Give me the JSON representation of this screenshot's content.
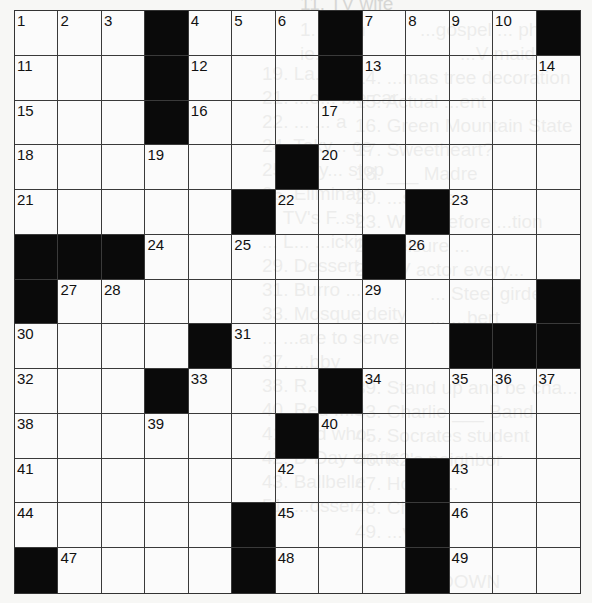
{
  "puzzle": {
    "rows": 13,
    "cols": 13,
    "colors": {
      "block": "#0a0a0a",
      "line": "#3a3a3a",
      "paper": "#f7f7f5",
      "ghost": "#d6d6d4"
    },
    "layout": [
      [
        "1",
        "2",
        "3",
        "#",
        "4",
        "5",
        "6",
        "#",
        "7",
        "8",
        "9",
        "10",
        "#"
      ],
      [
        "11",
        "",
        "",
        "#",
        "12",
        "",
        "",
        "#",
        "13",
        "",
        "",
        "",
        "14"
      ],
      [
        "15",
        "",
        "",
        "#",
        "16",
        "",
        "",
        "17",
        "",
        "",
        "",
        "",
        ""
      ],
      [
        "18",
        "",
        "",
        "19",
        "",
        "",
        "#",
        "20",
        "",
        "",
        "",
        "",
        ""
      ],
      [
        "21",
        "",
        "",
        "",
        "",
        "#",
        "22",
        "",
        "",
        "#",
        "23",
        "",
        ""
      ],
      [
        "#",
        "#",
        "#",
        "24",
        "",
        "25",
        "",
        "",
        "#",
        "26",
        "",
        "",
        ""
      ],
      [
        "#",
        "27",
        "28",
        "",
        "",
        "",
        "",
        "",
        "29",
        "",
        "",
        "",
        "#"
      ],
      [
        "30",
        "",
        "",
        "",
        "#",
        "31",
        "",
        "",
        "",
        "",
        "#",
        "#",
        "#"
      ],
      [
        "32",
        "",
        "",
        "#",
        "33",
        "",
        "",
        "#",
        "34",
        "",
        "35",
        "36",
        "37"
      ],
      [
        "38",
        "",
        "",
        "39",
        "",
        "",
        "#",
        "40",
        "",
        "",
        "",
        "",
        ""
      ],
      [
        "41",
        "",
        "",
        "",
        "",
        "",
        "42",
        "",
        "",
        "#",
        "43",
        "",
        ""
      ],
      [
        "44",
        "",
        "",
        "",
        "",
        "#",
        "45",
        "",
        "",
        "#",
        "46",
        "",
        ""
      ],
      [
        "#",
        "47",
        "",
        "",
        "",
        "#",
        "48",
        "",
        "",
        "#",
        "49",
        "",
        ""
      ]
    ]
  },
  "bleed_through_text": [
    "11. TV wife",
    "1. Span",
    "ie. Sc",
    "19. La... ble",
    "21. ...o... ble car",
    "22. ... ... a",
    "24. Toky... ce",
    "25. Tiny... stop",
    "26. Eliminate",
    "... TV's F..st",
    "... L... ...icking",
    "29. Dessert...",
    "31. Burro ...",
    "33. Mosque deity",
    "... ...are to serve",
    "37. ...bby",
    "38. R...",
    "40. Red ...le",
    "41. And who...",
    "42. D-Day crafts",
    "43. Ballbelle",
    "51. ...osser",
    "...gospel ... phrie...",
    "...V maid",
    "14. ...mas tree decoration",
    "15. Actual ...ent",
    "16. Green Mountain State",
    "17. Sweetheart?",
    "18. ___ Madre",
    "20. ...s-outs",
    "23. Word before ...tion",
    "25. Leisure ...",
    "26. TV actor every...",
    "... Steel girder",
    "... ...bert",
    "39. Stand up and be cha...",
    "43. Charlie ___ Band",
    "45. Socrates student",
    "46. K2's neighbor",
    "47. Horse ...",
    "48. Chides",
    "49. ...ver",
    "DOWN"
  ]
}
